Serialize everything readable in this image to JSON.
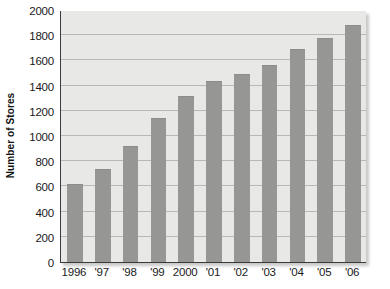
{
  "chart_data": {
    "type": "bar",
    "title": "",
    "xlabel": "",
    "ylabel": "Number of Stores",
    "categories": [
      "1996",
      "'97",
      "'98",
      "'99",
      "2000",
      "'01",
      "'02",
      "'03",
      "'04",
      "'05",
      "'06"
    ],
    "values": [
      620,
      740,
      920,
      1140,
      1320,
      1440,
      1490,
      1560,
      1690,
      1780,
      1880
    ],
    "ylim": [
      0,
      2000
    ],
    "ytick_values": [
      0,
      200,
      400,
      600,
      800,
      1000,
      1200,
      1400,
      1600,
      1800,
      2000
    ],
    "ytick_labels": [
      "0",
      "200",
      "400",
      "600",
      "800",
      "1000",
      "1200",
      "1400",
      "1600",
      "1800",
      "2000"
    ],
    "grid": true,
    "legend": null,
    "colors": {
      "bar_fill": "#969695",
      "plot_background": "#e8e8e6",
      "gridline": "#b8b8b5",
      "axis_line": "#3b3b3b",
      "text": "#1a1a1a",
      "page_background": "#ffffff"
    }
  }
}
